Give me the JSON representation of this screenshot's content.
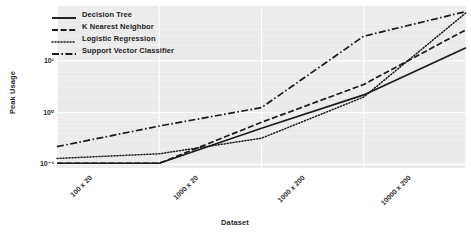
{
  "chart_data": {
    "type": "line",
    "title": "",
    "xlabel": "Dataset",
    "ylabel": "Peak Usage",
    "categories": [
      "100 x 20",
      "1000 x 20",
      "1000 x 200",
      "10000 x 200",
      "10000 x 2000"
    ],
    "yscale": "log",
    "ylim": [
      0.085,
      115
    ],
    "yticks": [
      0.1,
      1,
      10
    ],
    "ytick_labels": [
      "10⁻¹",
      "10⁰",
      "10¹"
    ],
    "grid": true,
    "legend_position": "upper left",
    "series": [
      {
        "name": "Decision Tree",
        "linestyle": "solid",
        "color": "#1a1a1a",
        "values": [
          0.105,
          0.105,
          0.5,
          2.2,
          18.0
        ]
      },
      {
        "name": "K Nearest Neighbor",
        "linestyle": "dashed",
        "color": "#1a1a1a",
        "values": [
          0.105,
          0.105,
          0.65,
          3.5,
          40.0
        ]
      },
      {
        "name": "Logistic Regression",
        "linestyle": "dotted",
        "color": "#1a1a1a",
        "values": [
          0.13,
          0.16,
          0.32,
          2.0,
          85.0
        ]
      },
      {
        "name": "Support Vector Classifier",
        "linestyle": "dashdot",
        "color": "#1a1a1a",
        "values": [
          0.22,
          0.55,
          1.25,
          30.0,
          90.0
        ]
      }
    ]
  },
  "style": {
    "page_background": "#ffffff",
    "plot_background": "#ebebeb",
    "grid_color": "#ffffff",
    "text_color": "#2a2a2a"
  }
}
